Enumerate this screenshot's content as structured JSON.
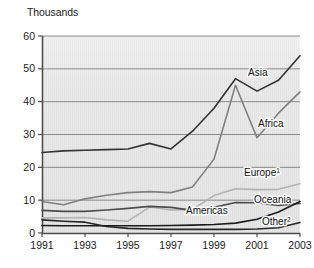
{
  "chart_data": {
    "type": "line",
    "title": "",
    "unit_label": "Thousands",
    "xlabel": "",
    "ylabel": "Thousands",
    "grid": true,
    "legend_position": "inline-end-labels",
    "xlim": [
      1991,
      2003
    ],
    "ylim": [
      0,
      60
    ],
    "ytick_values": [
      0,
      10,
      20,
      30,
      40,
      50,
      60
    ],
    "ytick_labels": [
      "0",
      "10",
      "20",
      "30",
      "40",
      "50",
      "60"
    ],
    "xtick_values": [
      1991,
      1993,
      1995,
      1997,
      1999,
      2001,
      2003
    ],
    "xtick_labels": [
      "1991",
      "1993",
      "1995",
      "1997",
      "1999",
      "2001",
      "2003"
    ],
    "x": [
      1991,
      1992,
      1993,
      1994,
      1995,
      1996,
      1997,
      1998,
      1999,
      2000,
      2001,
      2002,
      2003
    ],
    "series": [
      {
        "name": "Asia",
        "label": "Asia",
        "color": "#333333",
        "width": 1.6,
        "values": [
          24.5,
          25.0,
          25.2,
          25.4,
          25.6,
          27.3,
          25.6,
          31.0,
          38.0,
          47.0,
          43.2,
          46.5,
          54.0
        ]
      },
      {
        "name": "Africa",
        "label": "Africa",
        "color": "#808080",
        "width": 1.6,
        "values": [
          9.6,
          8.6,
          10.4,
          11.5,
          12.3,
          12.6,
          12.3,
          14.0,
          22.5,
          45.0,
          29.0,
          36.5,
          43.0
        ]
      },
      {
        "name": "Europe",
        "label": "Europe",
        "superscript": "1",
        "color": "#b3b3b3",
        "width": 1.6,
        "values": [
          4.6,
          4.6,
          4.7,
          4.0,
          3.6,
          7.9,
          7.0,
          7.2,
          11.4,
          13.5,
          13.2,
          13.3,
          15.0
        ]
      },
      {
        "name": "Americas",
        "label": "Americas",
        "color": "#4d4d4d",
        "width": 1.6,
        "values": [
          6.9,
          6.6,
          6.6,
          7.0,
          7.5,
          8.1,
          7.8,
          6.9,
          7.8,
          9.3,
          9.2,
          8.4,
          9.0
        ]
      },
      {
        "name": "Oceania",
        "label": "Oceania",
        "color": "#1a1a1a",
        "width": 1.6,
        "values": [
          2.3,
          2.2,
          2.2,
          2.2,
          2.2,
          2.2,
          2.3,
          2.4,
          2.6,
          3.0,
          4.2,
          6.4,
          9.6
        ]
      },
      {
        "name": "Other",
        "label": "Other",
        "superscript": "2",
        "color": "#262626",
        "width": 1.6,
        "values": [
          4.0,
          3.6,
          3.3,
          2.0,
          1.4,
          1.2,
          1.1,
          1.1,
          1.1,
          1.1,
          1.2,
          1.6,
          3.2
        ]
      }
    ],
    "annotations": [
      {
        "name": "asia-label",
        "text": "Asia",
        "sup": "",
        "x": 248,
        "y": 76
      },
      {
        "name": "africa-label",
        "text": "Africa",
        "sup": "",
        "x": 258,
        "y": 127
      },
      {
        "name": "europe-label",
        "text": "Europe",
        "sup": "1",
        "x": 244,
        "y": 176
      },
      {
        "name": "americas-label",
        "text": "Americas",
        "sup": "",
        "x": 186,
        "y": 214
      },
      {
        "name": "oceania-label",
        "text": "Oceania",
        "sup": "",
        "x": 254,
        "y": 203
      },
      {
        "name": "other-label",
        "text": "Other",
        "sup": "2",
        "x": 262,
        "y": 225
      }
    ],
    "colors": {
      "plot_background": "#e6e6e6",
      "grid_line": "#808080",
      "axis_line": "#4d4d4d",
      "text": "#1a1a1a"
    }
  }
}
